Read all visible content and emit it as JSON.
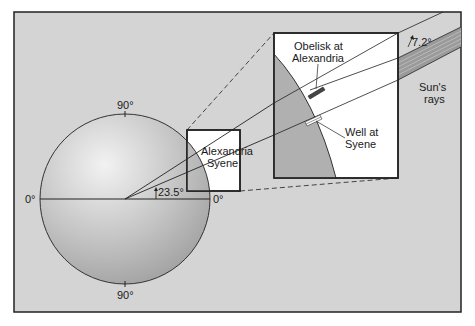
{
  "diagram": {
    "colors": {
      "background": "#d4d4d4",
      "frame": "#222222",
      "earth_light": "#e8e8e8",
      "earth_dark": "#a8a8a8",
      "inset_bg": "#ffffff",
      "rays_band": "#9a9a9a"
    },
    "earth_labels": {
      "top": "90°",
      "bottom": "90°",
      "left": "0°",
      "right": "0°",
      "angle": "23.5°"
    },
    "small_box": {
      "line1": "Alexandria",
      "line2": "Syene"
    },
    "inset": {
      "obelisk_line1": "Obelisk at",
      "obelisk_line2": "Alexandria",
      "well_line1": "Well at",
      "well_line2": "Syene",
      "angle": "7.2°"
    },
    "sun": {
      "line1": "Sun's",
      "line2": "rays"
    }
  }
}
